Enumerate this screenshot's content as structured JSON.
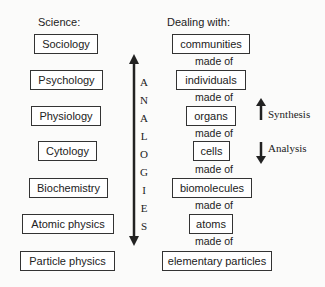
{
  "headers": {
    "science": "Science:",
    "dealing": "Dealing with:"
  },
  "sciences": [
    "Sociology",
    "Psychology",
    "Physiology",
    "Cytology",
    "Biochemistry",
    "Atomic physics",
    "Particle physics"
  ],
  "levels": [
    "communities",
    "individuals",
    "organs",
    "cells",
    "biomolecules",
    "atoms",
    "elementary particles"
  ],
  "connector": "made of",
  "analogies_letters": [
    "A",
    "N",
    "A",
    "L",
    "O",
    "G",
    "I",
    "E",
    "S"
  ],
  "synthesis_label": "Synthesis",
  "analysis_label": "Analysis"
}
